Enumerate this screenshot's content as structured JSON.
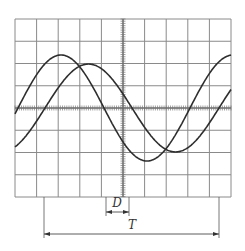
{
  "figure": {
    "type": "oscilloscope-display",
    "labels": {
      "phase_shift": "D",
      "period": "T"
    }
  },
  "graticule": {
    "columns": 10,
    "rows": 8,
    "left": 15,
    "right": 231,
    "top": 19,
    "bottom": 197,
    "center_x": 123,
    "center_y": 108,
    "grid_color": "#8a8a8a",
    "axis_style": "dotted-ticks"
  },
  "chart_data": {
    "type": "line",
    "title": "",
    "xlabel": "",
    "ylabel": "",
    "series": [
      {
        "name": "waveform-leading",
        "amplitude_divisions": 2.4,
        "amplitude_px": 53,
        "period_px": 172,
        "zero_crossing_up_px": 18,
        "color": "#2e2e2e"
      },
      {
        "name": "waveform-lagging",
        "amplitude_divisions": 2.0,
        "amplitude_px": 44,
        "period_px": 174,
        "zero_crossing_up_px": 45,
        "color": "#2e2e2e"
      }
    ],
    "annotations": [
      {
        "label": "D",
        "meaning": "time shift between waveforms",
        "x_start": 106,
        "x_end": 129,
        "arrow_y": 212,
        "text_x": 117,
        "text_y": 207
      },
      {
        "label": "T",
        "meaning": "period",
        "x_start": 44,
        "x_end": 219,
        "arrow_y": 234,
        "text_x": 132,
        "text_y": 229
      }
    ],
    "grid": true
  }
}
